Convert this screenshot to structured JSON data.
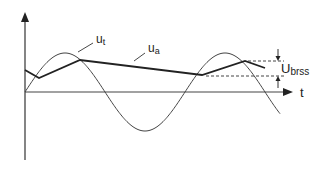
{
  "diagram": {
    "axes": {
      "x_label": "t",
      "y_label": ""
    },
    "curves": [
      {
        "id": "ut",
        "label": "u",
        "subscript": "t",
        "description": "sinusoidal transformer voltage"
      },
      {
        "id": "ua",
        "label": "u",
        "subscript": "a",
        "description": "output voltage with capacitor discharge ripple"
      }
    ],
    "annotation": {
      "label": "U",
      "subscript": "brss",
      "description": "peak-to-peak ripple voltage"
    },
    "colors": {
      "line": "#333333",
      "thick_line": "#222222",
      "dashed": "#444444"
    }
  }
}
